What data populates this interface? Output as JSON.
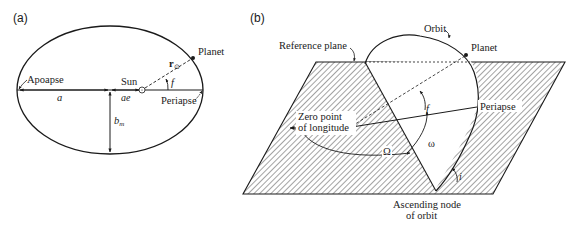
{
  "panel_a": {
    "label": "(a)",
    "title": "Orbital ellipse in plane",
    "labels": {
      "planet": "Planet",
      "sun": "Sun",
      "apoapse": "Apoapse",
      "periapse": "Periapse",
      "semi_major": "a",
      "focal_offset": "ae",
      "semi_minor": "b",
      "semi_minor_sub": "m",
      "radius_vector": "r",
      "radius_sub": "⊙",
      "true_anomaly": "f"
    }
  },
  "panel_b": {
    "label": "(b)",
    "title": "Orbit orientation relative to reference plane",
    "labels": {
      "orbit": "Orbit",
      "planet": "Planet",
      "reference_plane": "Reference plane",
      "zero_point_line1": "Zero point",
      "zero_point_line2": "of longitude",
      "periapse": "Periapse",
      "ascending_node_line1": "Ascending node",
      "ascending_node_line2": "of orbit",
      "true_anomaly": "f",
      "arg_periapsis": "ω",
      "long_asc_node": "Ω",
      "inclination": "i"
    }
  },
  "colors": {
    "ink": "#1a1a1a",
    "background": "#ffffff",
    "hatch": "#333333"
  }
}
